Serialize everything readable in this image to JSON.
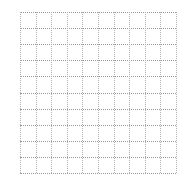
{
  "grid": {
    "rows": 10,
    "columns": 10,
    "line_style": "dotted",
    "line_color": "#9a9a9a",
    "background_color": "#ffffff"
  }
}
